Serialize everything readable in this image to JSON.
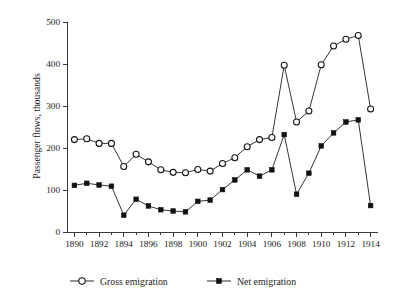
{
  "chart_data": {
    "type": "line",
    "title": "",
    "subtitle": "",
    "xlabel": "",
    "ylabel": "Passenger flows, thousands",
    "xlim": [
      1889.4,
      1914.6
    ],
    "ylim": [
      0,
      500
    ],
    "yticks": [
      0,
      100,
      200,
      300,
      400,
      500
    ],
    "ytick_labels": [
      "0",
      "100",
      "200",
      "300",
      "400",
      "500"
    ],
    "xticks": [
      1890,
      1891,
      1892,
      1893,
      1894,
      1895,
      1896,
      1897,
      1898,
      1899,
      1900,
      1901,
      1902,
      1903,
      1904,
      1905,
      1906,
      1907,
      1908,
      1909,
      1910,
      1911,
      1912,
      1913,
      1914
    ],
    "xtick_labels": [
      "1890",
      "",
      "1892",
      "",
      "1894",
      "",
      "1896",
      "",
      "1898",
      "",
      "1900",
      "",
      "1902",
      "",
      "1904",
      "",
      "1906",
      "",
      "1908",
      "",
      "1910",
      "",
      "1912",
      "",
      "1914"
    ],
    "grid": false,
    "legend_position": "below",
    "x": [
      1890,
      1891,
      1892,
      1893,
      1894,
      1895,
      1896,
      1897,
      1898,
      1899,
      1900,
      1901,
      1902,
      1903,
      1904,
      1905,
      1906,
      1907,
      1908,
      1909,
      1910,
      1911,
      1912,
      1913,
      1914
    ],
    "series": [
      {
        "name": "Gross emigration",
        "marker": "open-circle",
        "values": [
          220,
          222,
          211,
          211,
          156,
          185,
          167,
          148,
          142,
          141,
          149,
          145,
          163,
          177,
          203,
          220,
          225,
          397,
          262,
          288,
          398,
          443,
          459,
          468,
          293
        ]
      },
      {
        "name": "Net emigration",
        "marker": "filled-square",
        "values": [
          111,
          116,
          112,
          109,
          40,
          78,
          62,
          53,
          50,
          48,
          73,
          76,
          101,
          124,
          148,
          133,
          148,
          232,
          90,
          140,
          205,
          236,
          262,
          267,
          63
        ]
      }
    ]
  },
  "legend": {
    "items": [
      {
        "label": "Gross emigration",
        "marker": "open-circle-icon"
      },
      {
        "label": "Net emigration",
        "marker": "filled-square-icon"
      }
    ]
  },
  "style": {
    "background": "#ffffff",
    "line_color": "#111111",
    "axis_color": "#3a3a3a",
    "text_color": "#1a1a1a"
  }
}
